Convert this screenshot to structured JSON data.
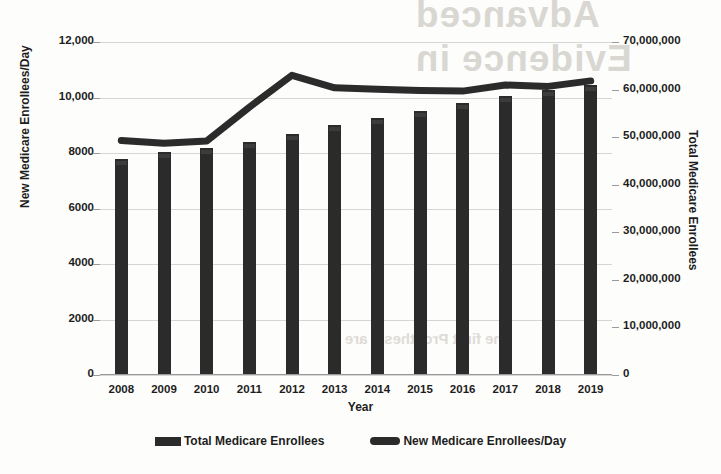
{
  "chart_data": {
    "type": "bar",
    "title": "",
    "subtitle": "",
    "xlabel": "Year",
    "ylabel": "New Medicare Enrollees/Day",
    "y2label": "Total Medicare Enrollees",
    "categories": [
      "2008",
      "2009",
      "2010",
      "2011",
      "2012",
      "2013",
      "2014",
      "2015",
      "2016",
      "2017",
      "2018",
      "2019"
    ],
    "series": [
      {
        "name": "Total Medicare Enrollees",
        "type": "bar",
        "axis": "right",
        "color": "#2b2b2b",
        "values": [
          45500000,
          46800000,
          47700000,
          49000000,
          50700000,
          52500000,
          54100000,
          55500000,
          57100000,
          58600000,
          59900000,
          61000000
        ]
      },
      {
        "name": "New Medicare Enrollees/Day",
        "type": "line",
        "axis": "left",
        "color": "#2b2b2b",
        "values": [
          8450,
          8350,
          8430,
          9650,
          10800,
          10350,
          10300,
          10250,
          10230,
          10450,
          10400,
          10600
        ]
      }
    ],
    "ylim": [
      0,
      12000
    ],
    "y2lim": [
      0,
      70000000
    ],
    "yticks": [
      "0",
      "2000",
      "4000",
      "6000",
      "8000",
      "10,000",
      "12,000"
    ],
    "ytick_values": [
      0,
      2000,
      4000,
      6000,
      8000,
      10000,
      12000
    ],
    "y2ticks": [
      "0",
      "10,000,000",
      "20,000,000",
      "30,000,000",
      "40,000,000",
      "50,000,000",
      "60,000,000",
      "70,000,000"
    ],
    "y2tick_values": [
      0,
      10000000,
      20000000,
      30000000,
      40000000,
      50000000,
      60000000,
      70000000
    ],
    "grid": true,
    "legend_position": "bottom",
    "legend": [
      {
        "label": "Total Medicare Enrollees",
        "marker": "bar-swatch"
      },
      {
        "label": "New Medicare Enrollees/Day",
        "marker": "line-swatch"
      }
    ]
  },
  "background_bleed": {
    "line1": "Advanced",
    "line2": "Evidence in",
    "line3": "the first Prosthesis are"
  }
}
